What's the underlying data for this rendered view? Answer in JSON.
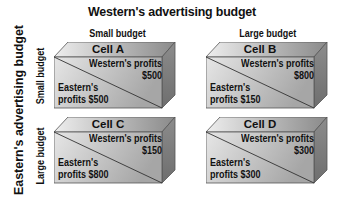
{
  "diagram": {
    "title": "Western's advertising budget",
    "column_labels": [
      "Small budget",
      "Large budget"
    ],
    "row_axis_title": "Eastern's advertising budget",
    "row_labels": [
      "Small budget",
      "Large budget"
    ],
    "cells": [
      {
        "name": "Cell A",
        "western_label": "Western's profits",
        "western_value": "$500",
        "eastern_label": "Eastern's",
        "eastern_value": "profits $500"
      },
      {
        "name": "Cell B",
        "western_label": "Western's profits",
        "western_value": "$800",
        "eastern_label": "Eastern's",
        "eastern_value": "profits $150"
      },
      {
        "name": "Cell C",
        "western_label": "Western's profits",
        "western_value": "$150",
        "eastern_label": "Eastern's",
        "eastern_value": "profits $800"
      },
      {
        "name": "Cell D",
        "western_label": "Western's profits",
        "western_value": "$300",
        "eastern_label": "Eastern's",
        "eastern_value": "profits $300"
      }
    ],
    "colors": {
      "top_face_light": "#e8e8e8",
      "top_face_dark": "#8a8a8a",
      "front_face_light": "#e2e2e2",
      "front_face_dark": "#a8a8a8",
      "side_face": "#7e7e7e",
      "edge": "#555555"
    }
  }
}
